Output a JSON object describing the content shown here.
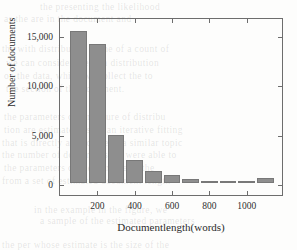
{
  "figure": {
    "background_color": "#fdfdfc",
    "frame_color": "#6d6d6d",
    "bar_color": "#8e8e8e"
  },
  "bleed_text": [
    {
      "text": "the   presenting   the  likelihood",
      "x": 40,
      "y": 2
    },
    {
      "text": "as the  are in the  document  and",
      "x": 4,
      "y": 14
    },
    {
      "text": "the  with  distribution   is the  of  a  count  of",
      "x": 2,
      "y": 44
    },
    {
      "text": "we can  consider  the  of a  distribution",
      "x": 6,
      "y": 58
    },
    {
      "text": "on  the  data, which  we  collect   the  to",
      "x": 4,
      "y": 71
    },
    {
      "text": "the  section  of  the  document.",
      "x": 6,
      "y": 84
    },
    {
      "text": "the  parameters  of  a  mixture   of   distribu",
      "x": 4,
      "y": 112
    },
    {
      "text": "tion  are estimated  using  an  iterative  fitting",
      "x": 4,
      "y": 125
    },
    {
      "text": "that  is  directly  applicable  to  a  similar  topic",
      "x": 2,
      "y": 138
    },
    {
      "text": "the   number   of  documents  we  were  able  to",
      "x": 2,
      "y": 150
    },
    {
      "text": "the  parameters  of  the  mixture  as  the",
      "x": 4,
      "y": 163
    },
    {
      "text": "from  a  set  of  estimated  document  length",
      "x": 2,
      "y": 176
    },
    {
      "text": "in  the  example  in  the  figure,  we",
      "x": 34,
      "y": 205
    },
    {
      "text": "a  sample  of  the  estimated  parameters",
      "x": 40,
      "y": 216
    },
    {
      "text": "the  per  whose  estimate  is  the  size  of  the",
      "x": 2,
      "y": 240
    }
  ],
  "chart_data": {
    "type": "bar",
    "title": "",
    "xlabel": "Documentlength(words)",
    "ylabel": "Number of documents",
    "xlim": [
      0,
      1200
    ],
    "ylim": [
      -700,
      16700
    ],
    "grid": false,
    "legend": null,
    "bar_width_words": 88,
    "x_ticks": [
      {
        "value": 200,
        "label": "200"
      },
      {
        "value": 400,
        "label": "400"
      },
      {
        "value": 600,
        "label": "600"
      },
      {
        "value": 800,
        "label": "800"
      },
      {
        "value": 1000,
        "label": "1000"
      }
    ],
    "y_ticks": [
      {
        "value": 0,
        "label": "0"
      },
      {
        "value": 5000,
        "label": "5,000"
      },
      {
        "value": 10000,
        "label": "10,000"
      },
      {
        "value": 15000,
        "label": "15,000"
      }
    ],
    "bins": [
      {
        "center": 100,
        "label": "100",
        "value": 15350
      },
      {
        "center": 200,
        "label": "200",
        "value": 14050
      },
      {
        "center": 300,
        "label": "300",
        "value": 4830
      },
      {
        "center": 400,
        "label": "400",
        "value": 2360
      },
      {
        "center": 500,
        "label": "500",
        "value": 1240
      },
      {
        "center": 600,
        "label": "600",
        "value": 820
      },
      {
        "center": 700,
        "label": "700",
        "value": 390
      },
      {
        "center": 800,
        "label": "800",
        "value": 210
      },
      {
        "center": 900,
        "label": "900",
        "value": 180
      },
      {
        "center": 1000,
        "label": "1000",
        "value": 130
      },
      {
        "center": 1100,
        "label": "1100",
        "value": 510
      }
    ]
  }
}
